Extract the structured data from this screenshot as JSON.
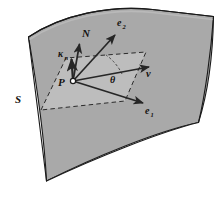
{
  "figure": {
    "background_color": "#ffffff",
    "surface_fill": "#a9a9a9",
    "tangent_plane_fill": "#c2c2c2",
    "outline_color": "#1a1a1a",
    "dash_color": "#2b2b2b",
    "vector_color": "#262626",
    "label_color": "#14110f"
  },
  "labels": {
    "surface": "S",
    "point": "P",
    "normal": "N",
    "normal_curvature": "κ",
    "normal_curvature_sub": "n",
    "basis_1": "e",
    "basis_1_sub": "1",
    "basis_2": "e",
    "basis_2_sub": "2",
    "tangent_vector": "v",
    "angle": "θ"
  },
  "label_positions": {
    "surface": {
      "x": 18,
      "y": 102
    },
    "point": {
      "x": 62,
      "y": 86
    },
    "normal": {
      "x": 84,
      "y": 36
    },
    "normal_curvature": {
      "x": 62,
      "y": 55
    },
    "normal_curvature_sub": {
      "x": 69,
      "y": 58
    },
    "basis_1": {
      "x": 147,
      "y": 113
    },
    "basis_1_sub": {
      "x": 153,
      "y": 116
    },
    "basis_2": {
      "x": 119,
      "y": 25
    },
    "basis_2_sub": {
      "x": 125,
      "y": 28
    },
    "tangent_vector": {
      "x": 148,
      "y": 75
    },
    "angle": {
      "x": 113,
      "y": 82
    }
  },
  "geometry": {
    "surface_outline": "M 28,38 C 60,16 108,6 152,10 L 213,17 C 212,47 208,90 198,124 L 46,180 C 44,150 38,96 28,38 Z",
    "surface_path": "M 28.5,37 C 62,15 110,5 152.5,9.5 L 213,16.5 C 212,46 208,88 198.5,122.5 C 160,132 95,158 46.5,181 C 44.5,150 38,95 28.5,37 Z",
    "point_origin": {
      "x": 73,
      "y": 81
    },
    "tangent_plane_corners": [
      {
        "x": 41,
        "y": 110
      },
      {
        "x": 66,
        "y": 58
      },
      {
        "x": 146,
        "y": 52
      },
      {
        "x": 125,
        "y": 101
      }
    ],
    "vectors": [
      {
        "name": "normal-vector",
        "label": "N",
        "from": {
          "x": 73,
          "y": 81
        },
        "to": {
          "x": 80,
          "y": 42
        }
      },
      {
        "name": "normal-curvature-vector",
        "label": "kappa-n",
        "from": {
          "x": 73,
          "y": 81
        },
        "to": {
          "x": 71,
          "y": 57
        }
      },
      {
        "name": "basis-vector-e2",
        "label": "e2",
        "from": {
          "x": 73,
          "y": 81
        },
        "to": {
          "x": 117,
          "y": 33
        }
      },
      {
        "name": "basis-vector-e1",
        "label": "e1",
        "from": {
          "x": 73,
          "y": 81
        },
        "to": {
          "x": 146,
          "y": 104
        }
      },
      {
        "name": "tangent-vector-v",
        "label": "v",
        "from": {
          "x": 73,
          "y": 81
        },
        "to": {
          "x": 152,
          "y": 66
        }
      }
    ],
    "angle_arc": {
      "label": "theta",
      "center": {
        "x": 73,
        "y": 81
      },
      "path": "M 119,72 A 47,47 0 0 0 105,56"
    }
  }
}
